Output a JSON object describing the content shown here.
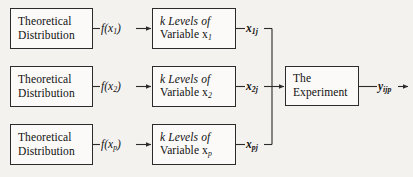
{
  "diagram": {
    "background_color": "#f3f2ef",
    "ink_color": "#2b2b2b",
    "rows": [
      {
        "source_line1": "Theoretical",
        "source_line2": "Distribution",
        "transfer_label": "f(x",
        "transfer_sub": "1",
        "transfer_close": ")",
        "levels_line1": "k Levels of",
        "levels_line2_prefix": "Variable x",
        "levels_line2_sub": "1",
        "output_var": "x",
        "output_sub": "1j"
      },
      {
        "source_line1": "Theoretical",
        "source_line2": "Distribution",
        "transfer_label": "f(x",
        "transfer_sub": "2",
        "transfer_close": ")",
        "levels_line1": "k Levels of",
        "levels_line2_prefix": "Variable x",
        "levels_line2_sub": "2",
        "output_var": "x",
        "output_sub": "2j"
      },
      {
        "source_line1": "Theoretical",
        "source_line2": "Distribution",
        "transfer_label": "f(x",
        "transfer_sub": "p",
        "transfer_close": ")",
        "levels_line1": "k Levels of",
        "levels_line2_prefix": "Variable x",
        "levels_line2_sub": "p",
        "output_var": "x",
        "output_sub": "pj"
      }
    ],
    "experiment": {
      "line1": "The",
      "line2": "Experiment",
      "response_var": "y",
      "response_sub": "ijp"
    }
  }
}
